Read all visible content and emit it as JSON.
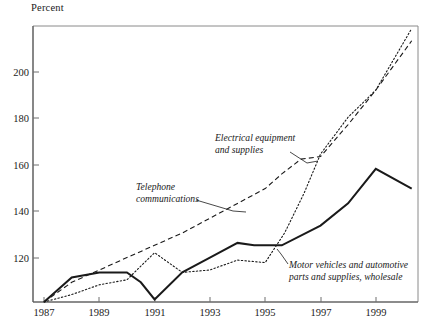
{
  "axis_title": "Percent",
  "chart_data": {
    "type": "line",
    "title": "",
    "subtitle": "",
    "xlabel": "",
    "ylabel": "Percent",
    "xlim": [
      1987,
      2000.5
    ],
    "ylim": [
      100,
      212
    ],
    "grid": false,
    "legend": "annotations-on-plot",
    "xticks": [
      1987,
      1989,
      1991,
      1993,
      1995,
      1997,
      1999
    ],
    "xtick_labels": [
      "1987",
      "1989",
      "1991",
      "1993",
      "1995",
      "1997",
      "1999"
    ],
    "yticks": [
      120,
      140,
      160,
      180,
      200
    ],
    "ytick_labels": [
      "120",
      "140",
      "160",
      "180",
      "200"
    ],
    "x": [
      1987,
      1988,
      1989,
      1990,
      1991,
      1992,
      1993,
      1994,
      1995,
      1996,
      1997,
      1998,
      1999,
      2000
    ],
    "series": [
      {
        "name": "Telephone communications",
        "style": "dashed",
        "color": "#1a1a1a",
        "values": [
          100,
          108,
          113,
          118,
          123,
          128,
          134,
          140,
          146,
          152,
          158,
          159,
          172,
          186,
          206
        ],
        "x": [
          1987,
          1988,
          1989,
          1990,
          1991,
          1992,
          1993,
          1994,
          1995,
          1995.6,
          1996.3,
          1997,
          1998,
          1999,
          2000.3
        ]
      },
      {
        "name": "Electrical equipment and supplies",
        "style": "dotted",
        "color": "#1a1a1a",
        "values": [
          100,
          103,
          107,
          109,
          120,
          112,
          113,
          117,
          116,
          128,
          144,
          160,
          175,
          186,
          211
        ],
        "x": [
          1987,
          1988,
          1989,
          1990,
          1991,
          1992,
          1993,
          1994,
          1995,
          1995.7,
          1996.4,
          1997,
          1998,
          1999,
          2000.3
        ]
      },
      {
        "name": "Motor vehicles and automotive parts and supplies, wholesale",
        "style": "solid",
        "color": "#1a1a1a",
        "values": [
          100,
          110,
          112,
          112,
          108,
          101,
          112,
          118,
          124,
          123,
          123,
          131,
          140,
          154,
          146
        ],
        "x": [
          1987,
          1988,
          1989,
          1990,
          1990.5,
          1991,
          1992,
          1993,
          1994,
          1994.6,
          1995.6,
          1997,
          1998,
          1999,
          2000.3
        ]
      }
    ],
    "annotations": [
      {
        "id": "electrical",
        "text_line1": "Electrical equipment",
        "text_line2": "and supplies"
      },
      {
        "id": "telephone",
        "text_line1": "Telephone",
        "text_line2": "communications"
      },
      {
        "id": "motor",
        "text_line1": "Motor vehicles and automotive",
        "text_line2": "parts and supplies, wholesale"
      }
    ]
  }
}
